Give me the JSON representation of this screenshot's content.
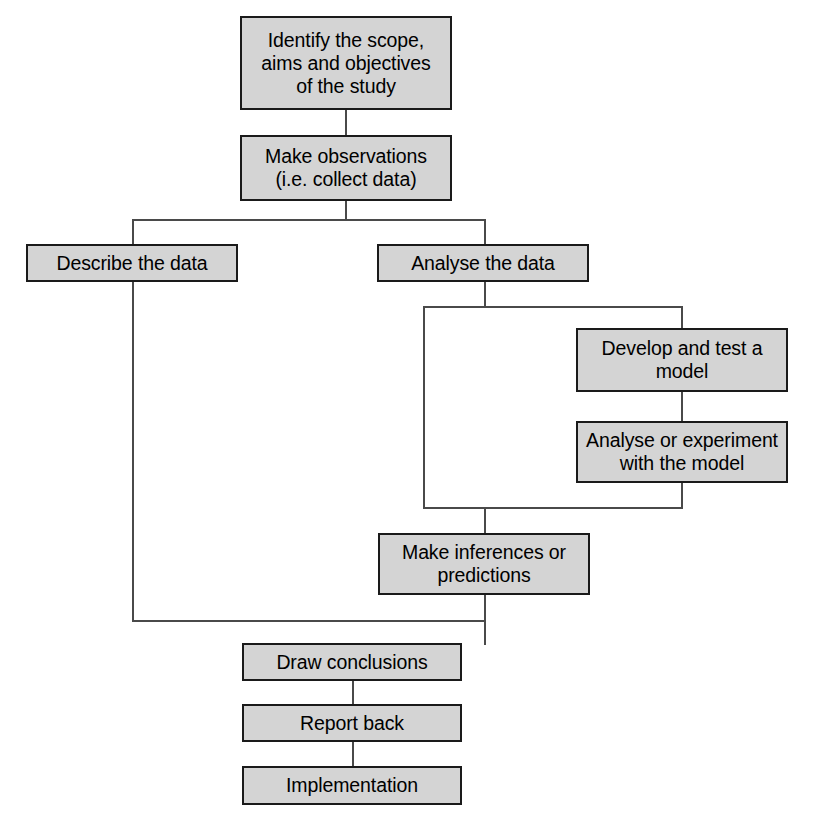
{
  "diagram": {
    "type": "flowchart",
    "style": {
      "node_fill": "#d4d4d4",
      "node_border": "#1a1a1a",
      "edge_color": "#4a4a4a",
      "background": "#ffffff",
      "text_color": "#000000"
    },
    "nodes": [
      {
        "id": "identify-scope",
        "label": "Identify the scope,\naims and objectives\nof the study",
        "x": 240,
        "y": 16,
        "w": 212,
        "h": 94
      },
      {
        "id": "make-observations",
        "label": "Make observations\n(i.e. collect data)",
        "x": 240,
        "y": 135,
        "w": 212,
        "h": 66
      },
      {
        "id": "describe-the-data",
        "label": "Describe the data",
        "x": 26,
        "y": 244,
        "w": 212,
        "h": 38
      },
      {
        "id": "analyse-the-data",
        "label": "Analyse the data",
        "x": 377,
        "y": 244,
        "w": 212,
        "h": 38
      },
      {
        "id": "develop-and-test-a-model",
        "label": "Develop and test a\nmodel",
        "x": 576,
        "y": 328,
        "w": 212,
        "h": 64
      },
      {
        "id": "analyse-or-experiment-with-the-model",
        "label": "Analyse or experiment\nwith the model",
        "x": 576,
        "y": 421,
        "w": 212,
        "h": 62
      },
      {
        "id": "make-inferences-or-predictions",
        "label": "Make inferences or\npredictions",
        "x": 378,
        "y": 533,
        "w": 212,
        "h": 62
      },
      {
        "id": "draw-conclusions",
        "label": "Draw conclusions",
        "x": 242,
        "y": 643,
        "w": 220,
        "h": 38
      },
      {
        "id": "report-back",
        "label": "Report back",
        "x": 242,
        "y": 704,
        "w": 220,
        "h": 38
      },
      {
        "id": "implementation",
        "label": "Implementation",
        "x": 242,
        "y": 766,
        "w": 220,
        "h": 39
      }
    ],
    "edges": [
      {
        "id": "identify-to-observations",
        "orient": "v",
        "x": 345,
        "y": 110,
        "len": 25
      },
      {
        "id": "observations-down-stub",
        "orient": "v",
        "x": 345,
        "y": 201,
        "len": 20
      },
      {
        "id": "split-under-observations",
        "orient": "h",
        "x": 132,
        "y": 219,
        "len": 354
      },
      {
        "id": "split-left-to-describe",
        "orient": "v",
        "x": 132,
        "y": 219,
        "len": 27
      },
      {
        "id": "split-right-to-analyse",
        "orient": "v",
        "x": 484,
        "y": 219,
        "len": 27
      },
      {
        "id": "describe-down-long",
        "orient": "v",
        "x": 132,
        "y": 281,
        "len": 341
      },
      {
        "id": "describe-to-draw-horizontal",
        "orient": "h",
        "x": 132,
        "y": 620,
        "len": 354
      },
      {
        "id": "analyse-down-stub",
        "orient": "v",
        "x": 484,
        "y": 282,
        "len": 26
      },
      {
        "id": "split-under-analyse",
        "orient": "h",
        "x": 423,
        "y": 306,
        "len": 260
      },
      {
        "id": "analyse-left-branch-down",
        "orient": "v",
        "x": 423,
        "y": 306,
        "len": 203
      },
      {
        "id": "analyse-right-branch-down",
        "orient": "v",
        "x": 681,
        "y": 306,
        "len": 24
      },
      {
        "id": "to-develop-model",
        "orient": "v",
        "x": 681,
        "y": 306,
        "len": 24
      },
      {
        "id": "develop-to-analyse-model",
        "orient": "v",
        "x": 681,
        "y": 392,
        "len": 31
      },
      {
        "id": "analyse-model-down",
        "orient": "v",
        "x": 681,
        "y": 483,
        "len": 26
      },
      {
        "id": "join-above-inferences",
        "orient": "h",
        "x": 423,
        "y": 507,
        "len": 260
      },
      {
        "id": "join-to-inferences",
        "orient": "v",
        "x": 484,
        "y": 507,
        "len": 28
      },
      {
        "id": "inferences-down",
        "orient": "v",
        "x": 484,
        "y": 595,
        "len": 27
      },
      {
        "id": "draw-down-from-junction",
        "orient": "v",
        "x": 484,
        "y": 620,
        "len": 25
      },
      {
        "id": "draw-to-report",
        "orient": "v",
        "x": 352,
        "y": 681,
        "len": 25
      },
      {
        "id": "report-to-implementation",
        "orient": "v",
        "x": 352,
        "y": 742,
        "len": 26
      }
    ]
  }
}
